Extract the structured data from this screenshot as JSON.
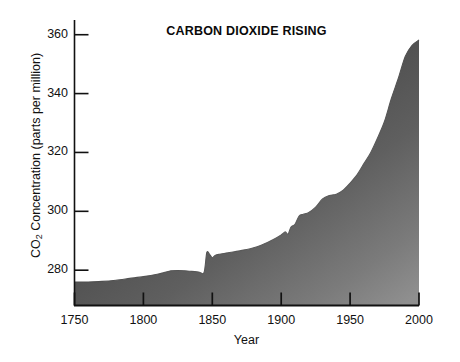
{
  "chart_data": {
    "type": "area",
    "title": "CARBON DIOXIDE RISING",
    "xlabel": "Year",
    "ylabel": "CO2 Concentration (parts per million)",
    "ylabel_prefix": "CO",
    "ylabel_sub": "2",
    "ylabel_suffix": " Concentration (parts per million)",
    "xlim": [
      1750,
      2000
    ],
    "ylim": [
      268,
      365
    ],
    "grid": false,
    "legend": "none",
    "xticks": [
      1750,
      1800,
      1850,
      1900,
      1950,
      2000
    ],
    "xtick_labels": [
      "1750",
      "1800",
      "1850",
      "1900",
      "1950",
      "2000"
    ],
    "yticks": [
      280,
      300,
      320,
      340,
      360
    ],
    "ytick_labels": [
      "280",
      "300",
      "320",
      "340",
      "360"
    ],
    "series": [
      {
        "name": "Atmospheric CO2 concentration",
        "x": [
          1750,
          1760,
          1770,
          1780,
          1790,
          1800,
          1810,
          1815,
          1820,
          1825,
          1830,
          1835,
          1840,
          1844,
          1846,
          1848,
          1850,
          1852,
          1855,
          1860,
          1865,
          1870,
          1875,
          1880,
          1885,
          1890,
          1895,
          1900,
          1903,
          1905,
          1907,
          1910,
          1913,
          1916,
          1920,
          1925,
          1930,
          1935,
          1938,
          1940,
          1945,
          1950,
          1955,
          1960,
          1965,
          1970,
          1975,
          1980,
          1985,
          1990,
          1995,
          2000
        ],
        "values": [
          276.0,
          276.0,
          276.2,
          276.6,
          277.2,
          277.8,
          278.6,
          279.2,
          279.8,
          279.9,
          279.8,
          279.6,
          279.4,
          279.2,
          286.0,
          285.4,
          284.2,
          285.0,
          285.4,
          285.8,
          286.2,
          286.6,
          287.0,
          287.6,
          288.4,
          289.4,
          290.6,
          292.0,
          293.0,
          292.2,
          294.6,
          295.6,
          298.4,
          299.0,
          299.6,
          301.4,
          304.2,
          305.4,
          305.6,
          305.8,
          307.2,
          309.6,
          312.4,
          316.2,
          320.0,
          325.0,
          330.6,
          338.4,
          345.2,
          352.6,
          356.4,
          358.2
        ]
      }
    ],
    "fill_style": "diagonal-gradient-gray",
    "colors": {
      "fill_dark": "#3f3f3f",
      "fill_mid": "#585858",
      "fill_light": "#8a8a8a",
      "axis": "#111111",
      "text": "#111111",
      "background": "#ffffff"
    },
    "annotations": []
  }
}
